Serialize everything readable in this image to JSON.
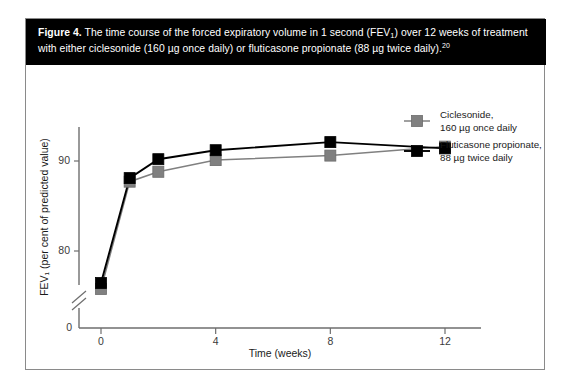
{
  "figure": {
    "caption_label": "Figure 4.",
    "caption_part1": " The time course of the forced expiratory volume in 1 second (FEV",
    "caption_sub": "1",
    "caption_part2": ") over 12 weeks of treatment with either ciclesonide (160 µg once daily) or fluticasone propionate (88 µg twice daily).",
    "caption_reference": "20"
  },
  "colors": {
    "ciclesonide": "#808080",
    "fluticasone": "#000000",
    "caption_bar": "#000000",
    "frame_border": "#8a8a8a",
    "axis": "#6e6e6e",
    "tick_text": "#3b3b3b"
  },
  "legend": {
    "items": [
      {
        "label_line1": "Ciclesonide,",
        "label_line2": "160 µg once daily",
        "marker_color": "#808080",
        "marker_name": "legend-marker-ciclesonide"
      },
      {
        "label_line1": "Fluticasone propionate,",
        "label_line2": "88 µg twice daily",
        "marker_color": "#000000",
        "marker_name": "legend-marker-fluticasone"
      }
    ]
  },
  "chart_data": {
    "type": "line",
    "title": "",
    "xlabel": "Time (weeks)",
    "ylabel": "FEV₁ (per cent of predicted value)",
    "x": [
      0,
      1,
      2,
      4,
      8,
      12
    ],
    "xticks": [
      "0",
      "4",
      "8",
      "12"
    ],
    "xtick_values": [
      0,
      4,
      8,
      12
    ],
    "xlim": [
      0,
      12
    ],
    "yticks": [
      "80",
      "90"
    ],
    "ytick_values": [
      80,
      90
    ],
    "y_origin_label": "0",
    "ylim": [
      74.5,
      93.5
    ],
    "axis_break": true,
    "grid": false,
    "legend_position": "right",
    "series": [
      {
        "name": "Ciclesonide, 160 µg once daily",
        "color": "#808080",
        "marker": "square",
        "values": [
          75.1,
          87.7,
          88.8,
          90.1,
          90.6,
          91.6
        ]
      },
      {
        "name": "Fluticasone propionate, 88 µg twice daily",
        "color": "#000000",
        "marker": "square",
        "values": [
          75.6,
          88.1,
          90.2,
          91.2,
          92.1,
          91.4
        ]
      }
    ]
  }
}
